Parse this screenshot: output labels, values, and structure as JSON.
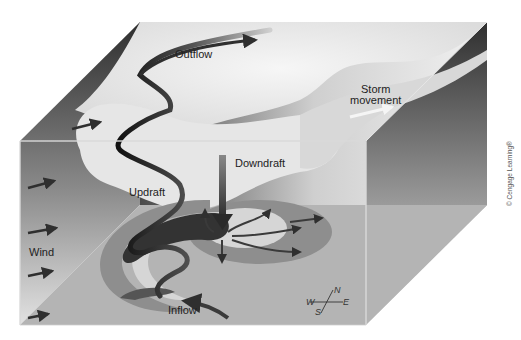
{
  "figure": {
    "labels": {
      "outflow": "Outflow",
      "storm_movement_line1": "Storm",
      "storm_movement_line2": "movement",
      "downdraft": "Downdraft",
      "updraft": "Updraft",
      "wind": "Wind",
      "inflow": "Inflow"
    },
    "compass": {
      "n": "N",
      "s": "S",
      "e": "E",
      "w": "W"
    },
    "copyright": "© Cengage Learning®"
  },
  "colors": {
    "background": "#ffffff",
    "box_top_dark": "#3a3a3a",
    "floor": "#b4b4b4",
    "ring_gray": "#8e8e8e",
    "ring_light": "#d6d6d6",
    "dark_core": "#333333",
    "cloud": "#ececec",
    "arrow": "#2f2f2f",
    "storm_arrow": "#f5f5f5",
    "edge": "#e6e6e6"
  }
}
